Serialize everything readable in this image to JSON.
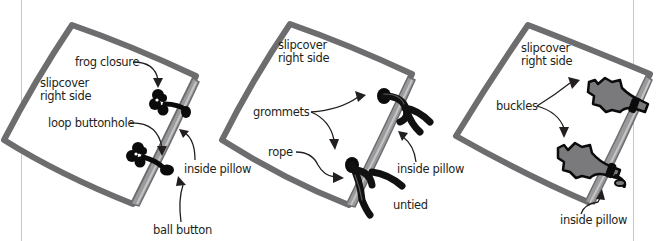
{
  "figure": {
    "panels": [
      {
        "id": "frog-closure",
        "labels": {
          "side": [
            "slipcover",
            "right side"
          ],
          "closure": "frog closure",
          "loop": "loop buttonhole",
          "inside": "inside pillow",
          "button": "ball button"
        }
      },
      {
        "id": "grommets",
        "labels": {
          "side": [
            "slipcover",
            "right side"
          ],
          "grommets": "grommets",
          "rope": "rope",
          "inside": "inside pillow",
          "untied": "untied"
        }
      },
      {
        "id": "buckles",
        "labels": {
          "side": [
            "slipcover",
            "right side"
          ],
          "buckles": "buckles",
          "inside": "inside pillow"
        }
      }
    ],
    "colors": {
      "frame": "#6d6d6f",
      "edge": "#9a9a9c",
      "ink": "#231f20",
      "buckle_fill": "#7a7a7c"
    }
  }
}
